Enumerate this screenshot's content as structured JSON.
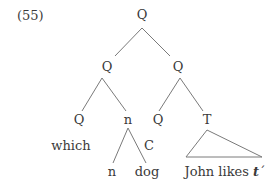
{
  "example": {
    "number": "(55)"
  },
  "tree": {
    "root": {
      "label": "Q"
    },
    "left_q": {
      "label": "Q"
    },
    "right_q": {
      "label": "Q"
    },
    "left_q_left": {
      "label": "Q"
    },
    "left_q_right": {
      "label": "n"
    },
    "right_q_left": {
      "label": "Q"
    },
    "right_q_right": {
      "label": "T"
    },
    "which": {
      "label": "which"
    },
    "c_label": {
      "label": "C"
    },
    "n_leaf": {
      "label": "n"
    },
    "dog_leaf": {
      "label": "dog"
    },
    "t_yield": {
      "prefix": "John likes ",
      "trace": "t",
      "prime": "´"
    }
  }
}
